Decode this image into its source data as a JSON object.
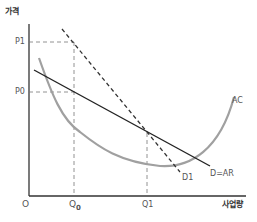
{
  "diagram": {
    "y_axis_label": "가격",
    "x_axis_label": "사업량",
    "origin_label": "O",
    "price_labels": {
      "p1": "P1",
      "p0": "P0"
    },
    "quantity_labels": {
      "q0": "Q",
      "q0_sub": "0",
      "q1": "Q1"
    },
    "curve_labels": {
      "ac": "AC",
      "d1": "D1",
      "d_ar": "D=AR"
    },
    "colors": {
      "axis": "#333333",
      "demand": "#222222",
      "d1": "#333333",
      "ac": "#a0a0a0",
      "guide": "#777777"
    }
  }
}
